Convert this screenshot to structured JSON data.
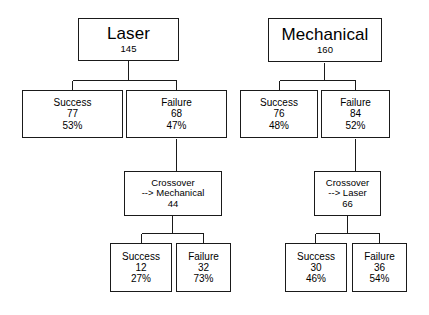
{
  "diagram": {
    "line_color": "#1a1a1a",
    "text_color": "#000000",
    "background": "#ffffff"
  },
  "trees": {
    "laser": {
      "root": {
        "label": "Laser",
        "count": "145"
      },
      "success": {
        "label": "Success",
        "count": "77",
        "percent": "53%"
      },
      "failure": {
        "label": "Failure",
        "count": "68",
        "percent": "47%"
      },
      "crossover": {
        "label": "Crossover",
        "arrow": "--> Mechanical",
        "count": "44"
      },
      "crossover_success": {
        "label": "Success",
        "count": "12",
        "percent": "27%"
      },
      "crossover_failure": {
        "label": "Failure",
        "count": "32",
        "percent": "73%"
      }
    },
    "mechanical": {
      "root": {
        "label": "Mechanical",
        "count": "160"
      },
      "success": {
        "label": "Success",
        "count": "76",
        "percent": "48%"
      },
      "failure": {
        "label": "Failure",
        "count": "84",
        "percent": "52%"
      },
      "crossover": {
        "label": "Crossover",
        "arrow": "--> Laser",
        "count": "66"
      },
      "crossover_success": {
        "label": "Success",
        "count": "30",
        "percent": "46%"
      },
      "crossover_failure": {
        "label": "Failure",
        "count": "36",
        "percent": "54%"
      }
    }
  }
}
